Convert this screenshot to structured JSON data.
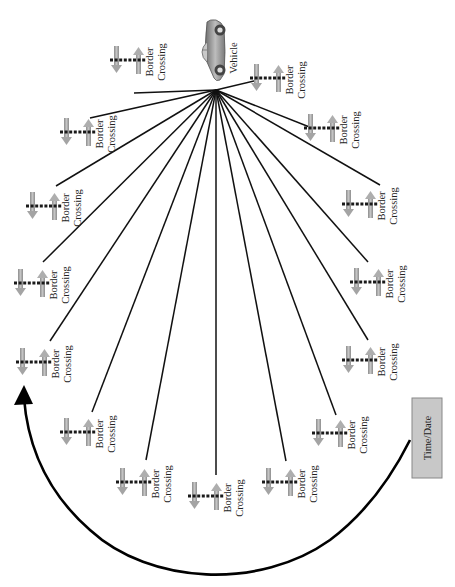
{
  "diagram": {
    "orientation": "rotated 90deg clockwise (text reads bottom-to-top)",
    "hub": {
      "label": "Vehicle",
      "icon": "car-icon",
      "x": 216,
      "y": 90
    },
    "node_label_line1": "Border",
    "node_label_line2": "Crossing",
    "node_icon": "border-crossing-icon",
    "nodes": [
      {
        "id": 1,
        "x": 268,
        "y": 78,
        "line_end": [
          258,
          80
        ]
      },
      {
        "id": 2,
        "x": 322,
        "y": 128,
        "line_end": [
          312,
          128
        ]
      },
      {
        "id": 3,
        "x": 360,
        "y": 204,
        "line_end": [
          380,
          185
        ]
      },
      {
        "id": 4,
        "x": 368,
        "y": 282,
        "line_end": [
          368,
          262
        ]
      },
      {
        "id": 5,
        "x": 360,
        "y": 360,
        "line_end": [
          368,
          340
        ]
      },
      {
        "id": 6,
        "x": 330,
        "y": 433,
        "line_end": [
          336,
          415
        ]
      },
      {
        "id": 7,
        "x": 280,
        "y": 482,
        "line_end": [
          286,
          461
        ]
      },
      {
        "id": 8,
        "x": 206,
        "y": 496,
        "line_end": [
          216,
          475
        ]
      },
      {
        "id": 9,
        "x": 134,
        "y": 482,
        "line_end": [
          146,
          460
        ]
      },
      {
        "id": 10,
        "x": 78,
        "y": 432,
        "line_end": [
          92,
          412
        ]
      },
      {
        "id": 11,
        "x": 34,
        "y": 362,
        "line_end": [
          50,
          341
        ]
      },
      {
        "id": 12,
        "x": 32,
        "y": 283,
        "line_end": [
          43,
          262
        ]
      },
      {
        "id": 13,
        "x": 44,
        "y": 206,
        "line_end": [
          56,
          186
        ]
      },
      {
        "id": 14,
        "x": 78,
        "y": 132,
        "line_end": [
          90,
          118
        ]
      },
      {
        "id": 15,
        "x": 128,
        "y": 60,
        "line_end": [
          134,
          93
        ]
      }
    ],
    "timebox": {
      "label": "Time/Date",
      "x": 412,
      "y": 398,
      "width": 30,
      "height": 80,
      "fill": "#c8c8c8",
      "stroke": "#888888"
    },
    "arrow": {
      "description": "curved arrow from Time/Date box sweeping around bottom to upper-left",
      "color": "#000000"
    },
    "colors": {
      "line": "#111111",
      "arrow_down": "#a8a8a8",
      "arrow_up": "#b0b0b0",
      "dash": "#1a1a1a",
      "car_body": "#9a9a9a"
    }
  }
}
